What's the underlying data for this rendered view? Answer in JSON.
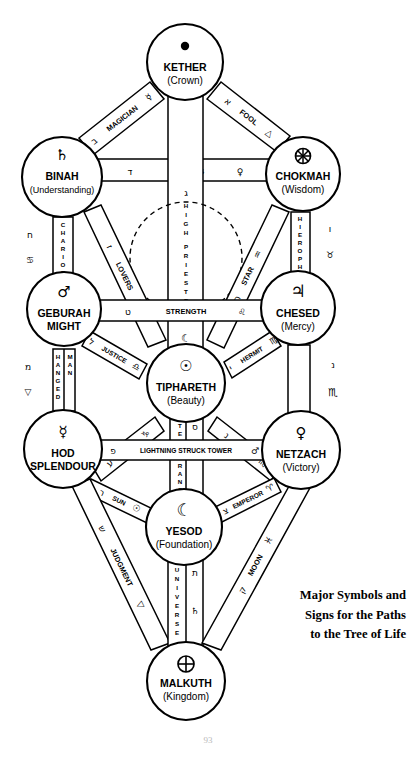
{
  "figure": {
    "title": "Tree of Life",
    "caption_lines": [
      "Major Symbols and",
      "Signs for the Paths",
      "to the Tree of Life"
    ],
    "page_number": "93",
    "stroke_color": "#000000",
    "background_color": "#ffffff"
  },
  "sephiroth": [
    {
      "id": "kether",
      "name": "KETHER",
      "sub": "(Crown)",
      "glyph": "⬤",
      "cx": 185,
      "cy": 62,
      "r": 38
    },
    {
      "id": "binah",
      "name": "BINAH",
      "sub": "(Understanding)",
      "glyph": "♄",
      "cx": 62,
      "cy": 177,
      "r": 40
    },
    {
      "id": "chokmah",
      "name": "CHOKMAH",
      "sub": "(Wisdom)",
      "glyph": "⊕",
      "cx": 303,
      "cy": 174,
      "r": 37
    },
    {
      "id": "geburah",
      "name": "GEBURAH",
      "sub": "MIGHT",
      "glyph": "♂",
      "cx": 64,
      "cy": 309,
      "r": 37
    },
    {
      "id": "chesed",
      "name": "CHESED",
      "sub": "(Mercy)",
      "glyph": "♃",
      "cx": 298,
      "cy": 308,
      "r": 37
    },
    {
      "id": "tiphareth",
      "name": "TIPHARETH",
      "sub": "(Beauty)",
      "glyph": "☉",
      "cx": 186,
      "cy": 383,
      "r": 39
    },
    {
      "id": "hod",
      "name": "HOD",
      "sub": "SPLENDOUR",
      "glyph": "☿",
      "cx": 63,
      "cy": 449,
      "r": 39
    },
    {
      "id": "netzach",
      "name": "NETZACH",
      "sub": "(Victory)",
      "glyph": "♀",
      "cx": 301,
      "cy": 450,
      "r": 39
    },
    {
      "id": "yesod",
      "name": "YESOD",
      "sub": "(Foundation)",
      "glyph": "☾",
      "cx": 184,
      "cy": 527,
      "r": 38
    },
    {
      "id": "malkuth",
      "name": "MALKUTH",
      "sub": "(Kingdom)",
      "glyph": "⊕",
      "cx": 186,
      "cy": 681,
      "r": 39
    }
  ],
  "paths": [
    {
      "id": "magician",
      "label": "MAGICIAN",
      "hebrew": "ב",
      "sign": "☿",
      "from": "kether",
      "to": "binah"
    },
    {
      "id": "fool",
      "label": "FOOL",
      "hebrew": "א",
      "sign": "△",
      "from": "kether",
      "to": "chokmah"
    },
    {
      "id": "empress",
      "label": "EMPRESS",
      "hebrew": "ד",
      "sign": "♀",
      "from": "binah",
      "to": "chokmah"
    },
    {
      "id": "high-priestess",
      "label": "HIGH PRIESTESS",
      "hebrew": "ג",
      "sign": "☾",
      "from": "kether",
      "to": "tiphareth"
    },
    {
      "id": "chariot",
      "label": "CHARIOT",
      "hebrew": "ח",
      "sign": "♋",
      "from": "binah",
      "to": "geburah"
    },
    {
      "id": "hierophant",
      "label": "HIEROPHANT",
      "hebrew": "ו",
      "sign": "♉",
      "from": "chokmah",
      "to": "chesed"
    },
    {
      "id": "lovers",
      "label": "LOVERS",
      "hebrew": "ז",
      "sign": "♊",
      "from": "binah",
      "to": "tiphareth"
    },
    {
      "id": "star",
      "label": "STAR",
      "hebrew": "ה",
      "sign": "♒",
      "from": "chokmah",
      "to": "tiphareth"
    },
    {
      "id": "strength",
      "label": "STRENGTH",
      "hebrew": "ט",
      "sign": "♌",
      "from": "geburah",
      "to": "chesed"
    },
    {
      "id": "justice",
      "label": "JUSTICE",
      "hebrew": "ל",
      "sign": "♎",
      "from": "geburah",
      "to": "tiphareth"
    },
    {
      "id": "hermit",
      "label": "HERMIT",
      "hebrew": "י",
      "sign": "♍",
      "from": "chesed",
      "to": "tiphareth"
    },
    {
      "id": "hanged-man",
      "label": "HANGED MAN",
      "hebrew": "מ",
      "sign": "▽",
      "from": "geburah",
      "to": "hod"
    },
    {
      "id": "death",
      "label": "DEATH",
      "hebrew": "נ",
      "sign": "♏",
      "from": "chesed",
      "to": "netzach"
    },
    {
      "id": "devil",
      "label": "DEVIL",
      "hebrew": "ע",
      "sign": "♑",
      "from": "hod",
      "to": "tiphareth"
    },
    {
      "id": "temperance",
      "label": "TEMPERANCE",
      "hebrew": "ס",
      "sign": "♐",
      "from": "tiphareth",
      "to": "yesod"
    },
    {
      "id": "tower",
      "label": "LIGHTNING STRUCK TOWER",
      "hebrew": "פ",
      "sign": "♂",
      "from": "hod",
      "to": "netzach"
    },
    {
      "id": "sun",
      "label": "SUN",
      "hebrew": "ר",
      "sign": "☉",
      "from": "hod",
      "to": "yesod"
    },
    {
      "id": "emperor",
      "label": "EMPEROR",
      "hebrew": "צ",
      "sign": "♈",
      "from": "netzach",
      "to": "yesod"
    },
    {
      "id": "judgment",
      "label": "JUDGMENT",
      "hebrew": "ש",
      "sign": "▽",
      "from": "hod",
      "to": "malkuth"
    },
    {
      "id": "universe",
      "label": "UNIVERSE",
      "hebrew": "ת",
      "sign": "♄",
      "from": "yesod",
      "to": "malkuth"
    },
    {
      "id": "moon",
      "label": "MOON",
      "hebrew": "ק",
      "sign": "♓",
      "from": "netzach",
      "to": "malkuth"
    }
  ]
}
